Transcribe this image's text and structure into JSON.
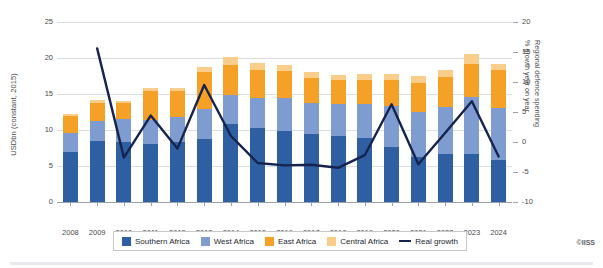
{
  "credit": "©IISS",
  "axes": {
    "left_title": "USDbn (constant, 2015)",
    "right_title_line1": "Regional defence spending",
    "right_title_line2": "% growth year on year",
    "left_ticks": [
      "25",
      "20",
      "15",
      "10",
      "5",
      "0"
    ],
    "right_ticks": [
      "20",
      "15",
      "10",
      "5",
      "0",
      "-5",
      "-10"
    ]
  },
  "legend": {
    "items": [
      {
        "label": "Southern Africa",
        "color": "#2e5fa3",
        "type": "swatch"
      },
      {
        "label": "West Africa",
        "color": "#7e9cd0",
        "type": "swatch"
      },
      {
        "label": "East Africa",
        "color": "#f5a026",
        "type": "swatch"
      },
      {
        "label": "Central Africa",
        "color": "#fbcd8a",
        "type": "swatch"
      },
      {
        "label": "Real growth",
        "color": "#17234f",
        "type": "line"
      }
    ]
  },
  "chart_data": {
    "type": "bar",
    "title": "",
    "subtitle": "",
    "xlabel": "",
    "ylabel": "USDbn (constant, 2015)",
    "ylabel_secondary": "Regional defence spending % growth year on year",
    "ylim": [
      0,
      25
    ],
    "ylim_secondary": [
      -10,
      20
    ],
    "grid": true,
    "legend_position": "bottom",
    "stacked": true,
    "categories": [
      "2008",
      "2009",
      "2010",
      "2011",
      "2012",
      "2013",
      "2014",
      "2015",
      "2016",
      "2017",
      "2018",
      "2019",
      "2020",
      "2021",
      "2022",
      "2023",
      "2024"
    ],
    "series": [
      {
        "name": "Southern Africa",
        "color": "#2e5fa3",
        "values": [
          7.0,
          8.5,
          8.3,
          8.1,
          8.3,
          8.7,
          10.8,
          10.3,
          9.8,
          9.4,
          9.2,
          8.9,
          7.6,
          6.3,
          6.6,
          6.7,
          5.9
        ]
      },
      {
        "name": "West Africa",
        "color": "#7e9cd0",
        "values": [
          2.6,
          2.8,
          3.2,
          3.3,
          3.5,
          4.2,
          4.0,
          4.2,
          4.6,
          4.3,
          4.4,
          4.7,
          5.8,
          6.2,
          6.6,
          7.9,
          7.2
        ]
      },
      {
        "name": "East Africa",
        "color": "#f5a026",
        "values": [
          2.3,
          2.5,
          2.2,
          4.0,
          3.6,
          5.2,
          4.2,
          3.8,
          3.8,
          3.5,
          3.3,
          3.4,
          3.5,
          4.0,
          4.1,
          4.6,
          5.2
        ]
      },
      {
        "name": "Central Africa",
        "color": "#fbcd8a",
        "values": [
          0.3,
          0.4,
          0.3,
          0.4,
          0.4,
          0.6,
          1.1,
          1.0,
          0.9,
          0.9,
          0.8,
          0.8,
          0.9,
          1.0,
          1.1,
          1.3,
          0.9
        ]
      }
    ],
    "line_series": {
      "name": "Real growth",
      "color": "#17234f",
      "axis": "secondary",
      "x": [
        "2009",
        "2010",
        "2011",
        "2012",
        "2013",
        "2014",
        "2015",
        "2016",
        "2017",
        "2018",
        "2019",
        "2020",
        "2021",
        "2022",
        "2023",
        "2024"
      ],
      "values": [
        15.6,
        -2.6,
        4.4,
        -1.1,
        9.5,
        1.0,
        -3.5,
        -3.9,
        -3.8,
        -4.3,
        -2.2,
        6.3,
        -3.7,
        1.5,
        6.8,
        -2.4
      ]
    }
  }
}
